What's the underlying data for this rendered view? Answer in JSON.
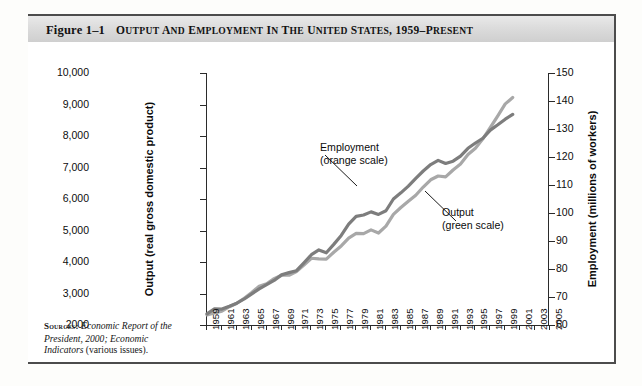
{
  "figure": {
    "number_label": "Figure 1–1",
    "title": "Output and Employment in the United States, 1959–Present",
    "title_plain": "OUTPUT AND EMPLOYMENT IN THE UNITED STATES, 1959-PRESENT"
  },
  "sources": {
    "label": "Sources:",
    "line1_italic": "Economic Report of",
    "line2_italic": "the President, 2000; Economic",
    "line3_italic": "Indicators",
    "line3_roman": " (various issues)."
  },
  "annotations": {
    "employment": {
      "line1": "Employment",
      "line2": "(orange scale)"
    },
    "output": {
      "line1": "Output",
      "line2": "(green scale)"
    }
  },
  "chart_data": {
    "type": "line",
    "title": "Output and Employment in the United States, 1959–Present",
    "xlabel": "",
    "ylabel": "Output (real gross domestic product)",
    "y2label": "Employment (millions of workers)",
    "grid": false,
    "legend_position": "inline-annotations",
    "xlim": [
      1959,
      2005
    ],
    "ylim": [
      2000,
      10000
    ],
    "y2lim": [
      60,
      150
    ],
    "yticks": [
      "2000",
      "3,000",
      "4,000",
      "5,000",
      "6,000",
      "7,000",
      "8,000",
      "9,000",
      "10,000"
    ],
    "ytick_values": [
      2000,
      3000,
      4000,
      5000,
      6000,
      7000,
      8000,
      9000,
      10000
    ],
    "y2ticks": [
      "60",
      "70",
      "80",
      "90",
      "100",
      "110",
      "120",
      "130",
      "140",
      "150"
    ],
    "y2tick_values": [
      60,
      70,
      80,
      90,
      100,
      110,
      120,
      130,
      140,
      150
    ],
    "xticks": [
      "1959",
      "1961",
      "1963",
      "1965",
      "1967",
      "1969",
      "1971",
      "1973",
      "1975",
      "1977",
      "1979",
      "1981",
      "1983",
      "1985",
      "1987",
      "1989",
      "1991",
      "1993",
      "1995",
      "1997",
      "1999",
      "2001",
      "2003",
      "2005"
    ],
    "x": [
      1959,
      1960,
      1961,
      1962,
      1963,
      1964,
      1965,
      1966,
      1967,
      1968,
      1969,
      1970,
      1971,
      1972,
      1973,
      1974,
      1975,
      1976,
      1977,
      1978,
      1979,
      1980,
      1981,
      1982,
      1983,
      1984,
      1985,
      1986,
      1987,
      1988,
      1989,
      1990,
      1991,
      1992,
      1993,
      1994,
      1995,
      1996,
      1997,
      1998,
      1999,
      2000
    ],
    "series": [
      {
        "name": "Output (green scale)",
        "axis": "left",
        "color": "#a8a8a8",
        "unit": "billions of chained dollars, real GDP",
        "values": [
          2320,
          2380,
          2440,
          2580,
          2690,
          2850,
          3030,
          3230,
          3310,
          3470,
          3580,
          3580,
          3700,
          3900,
          4120,
          4100,
          4090,
          4310,
          4510,
          4760,
          4910,
          4900,
          5020,
          4920,
          5140,
          5510,
          5730,
          5930,
          6120,
          6380,
          6610,
          6730,
          6700,
          6920,
          7110,
          7410,
          7610,
          7910,
          8270,
          8640,
          9020,
          9220
        ]
      },
      {
        "name": "Employment (orange scale)",
        "axis": "right",
        "color": "#7d7d7d",
        "unit": "millions of workers",
        "values": [
          64.0,
          65.8,
          65.7,
          66.7,
          67.8,
          69.3,
          71.1,
          72.9,
          74.4,
          75.9,
          77.9,
          78.7,
          79.4,
          82.2,
          85.1,
          86.8,
          85.8,
          88.8,
          92.0,
          96.0,
          98.8,
          99.3,
          100.4,
          99.5,
          100.8,
          105.0,
          107.2,
          109.6,
          112.4,
          115.0,
          117.3,
          118.8,
          117.7,
          118.5,
          120.3,
          123.1,
          125.0,
          126.7,
          129.6,
          131.5,
          133.5,
          135.2
        ]
      }
    ]
  }
}
